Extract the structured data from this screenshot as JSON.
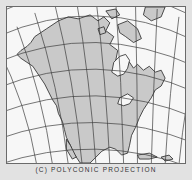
{
  "figure": {
    "caption": "(C) POLYCONIC PROJECTION",
    "projection": "polyconic",
    "region": "North America"
  },
  "colors": {
    "background": "#e2e2e2",
    "ocean": "#f7f7f7",
    "land": "#c9c9c9",
    "graticule": "#3a3a3a",
    "coastline": "#222222"
  }
}
